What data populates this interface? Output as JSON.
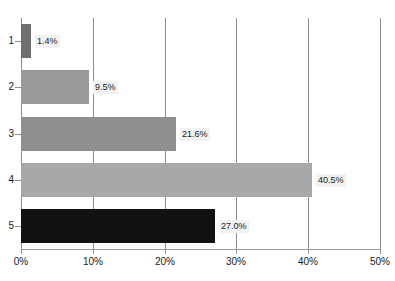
{
  "chart_data": {
    "type": "bar",
    "orientation": "horizontal",
    "title": "",
    "xlabel": "",
    "ylabel": "",
    "categories": [
      "1",
      "2",
      "3",
      "4",
      "5"
    ],
    "values": [
      1.4,
      9.5,
      21.6,
      40.5,
      27.0
    ],
    "value_labels": [
      "1.4%",
      "9.5%",
      "21.6%",
      "40.5%",
      "27.0%"
    ],
    "bar_colors": [
      "#6f6f6f",
      "#9a9a9a",
      "#8f8f8f",
      "#a8a8a8",
      "#121212"
    ],
    "xlim": [
      0,
      50
    ],
    "xticks": [
      0,
      10,
      20,
      30,
      40,
      50
    ],
    "xtick_labels": [
      "0%",
      "10%",
      "20%",
      "30%",
      "40%",
      "50%"
    ],
    "grid": "vertical",
    "legend": "none",
    "value_label_background": "#f2f2f2",
    "axis_color": "#8d8d8d",
    "text_color": "#1a1a1a"
  },
  "title_remnant": ""
}
